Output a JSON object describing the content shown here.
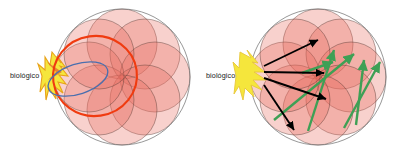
{
  "figure": {
    "title": "",
    "background_color": "#ffffff",
    "width": 393,
    "height": 153,
    "panel_count": 2
  },
  "palette": {
    "outer_circle_stroke": "#6b6b6b",
    "petal_fill": "#e8675a",
    "petal_stroke": "#5a3a34",
    "highlight_circle_stroke": "#f03b10",
    "ellipse_stroke": "#4a6fae",
    "region_fill": "#f5e63c",
    "region_stroke": "#e8a31a",
    "black_arrow": "#000000",
    "green_arrow": "#3ea055",
    "label_color": "#1a1a1a"
  },
  "panels": [
    {
      "id": "left",
      "name": "panel-left",
      "label": "biológico",
      "rosette": {
        "center_x": 122,
        "center_y": 77,
        "outer_radius": 68,
        "petal_count": 8,
        "petal_radius": 35,
        "petal_orbit": 33
      },
      "region": {
        "name": "biologico-region",
        "shape": "star-burst",
        "center_x": 56,
        "center_y": 76
      },
      "overlays": [
        {
          "name": "highlight-circle",
          "type": "circle",
          "cx": 95,
          "cy": 76,
          "rx": 42,
          "ry": 40,
          "rotation": -8,
          "color": "#f03b10"
        },
        {
          "name": "scope-ellipse",
          "type": "ellipse",
          "cx": 78,
          "cy": 79,
          "rx": 31,
          "ry": 15,
          "rotation": -18,
          "color": "#4a6fae"
        }
      ],
      "arrows": []
    },
    {
      "id": "right",
      "name": "panel-right",
      "label": "biológico",
      "rosette": {
        "center_x": 122,
        "center_y": 77,
        "outer_radius": 68,
        "petal_count": 8,
        "petal_radius": 35,
        "petal_orbit": 33
      },
      "region": {
        "name": "biologico-region",
        "shape": "wedge-blob",
        "center_x": 59,
        "center_y": 76
      },
      "overlays": [],
      "arrows": [
        {
          "name": "black-arrow-1",
          "color": "#000000",
          "x1": 68,
          "y1": 66,
          "x2": 122,
          "y2": 40
        },
        {
          "name": "black-arrow-2",
          "color": "#000000",
          "x1": 68,
          "y1": 72,
          "x2": 128,
          "y2": 73
        },
        {
          "name": "black-arrow-3",
          "color": "#000000",
          "x1": 68,
          "y1": 78,
          "x2": 130,
          "y2": 99
        },
        {
          "name": "black-arrow-4",
          "color": "#000000",
          "x1": 68,
          "y1": 85,
          "x2": 98,
          "y2": 130
        },
        {
          "name": "green-arrow-1",
          "color": "#3ea055",
          "x1": 112,
          "y1": 131,
          "x2": 138,
          "y2": 50
        },
        {
          "name": "green-arrow-2",
          "color": "#3ea055",
          "x1": 106,
          "y1": 73,
          "x2": 137,
          "y2": 62
        },
        {
          "name": "green-arrow-3",
          "color": "#3ea055",
          "x1": 78,
          "y1": 120,
          "x2": 158,
          "y2": 54
        },
        {
          "name": "green-arrow-4",
          "color": "#3ea055",
          "x1": 160,
          "y1": 125,
          "x2": 168,
          "y2": 60
        },
        {
          "name": "green-arrow-5",
          "color": "#3ea055",
          "x1": 148,
          "y1": 128,
          "x2": 184,
          "y2": 62
        }
      ]
    }
  ]
}
